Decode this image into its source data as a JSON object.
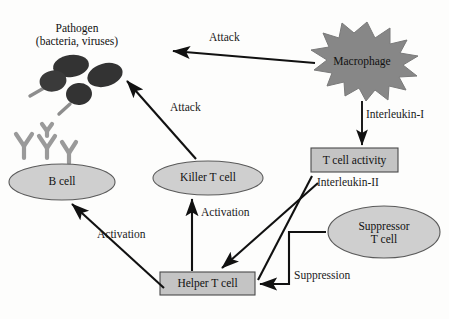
{
  "figure": {
    "background_color": "#fdfdfc",
    "line_color": "#111111",
    "cell_fill": "#cfcfcf",
    "cell_stroke": "#555555",
    "box_fill": "#c4c4c4",
    "box_stroke": "#4a4a4a",
    "macrophage_fill": "#878787",
    "macrophage_stroke": "#6f6f6f",
    "pathogen_fill": "#3a3a3a",
    "antibody_color": "#9a9a9a"
  },
  "nodes": {
    "pathogen": {
      "label_line1": "Pathogen",
      "label_line2": "(bacteria, viruses)",
      "shape": "dark-ellipse-cluster"
    },
    "antibodies": {
      "name": "antibody",
      "shape": "y-shape",
      "count": 3
    },
    "b_cell": {
      "label": "B cell",
      "shape": "ellipse"
    },
    "killer_t_cell": {
      "label": "Killer T cell",
      "shape": "ellipse"
    },
    "helper_t_cell": {
      "label": "Helper T cell",
      "shape": "rectangle"
    },
    "suppressor_t_cell": {
      "label_line1": "Suppressor",
      "label_line2": "T cell",
      "shape": "ellipse"
    },
    "macrophage": {
      "label": "Macrophage",
      "shape": "spiky-star"
    },
    "t_cell_activity": {
      "label": "T cell activity",
      "shape": "rectangle"
    }
  },
  "edge_labels": {
    "attack_macrophage_to_pathogen": "Attack",
    "attack_killer_to_pathogen": "Attack",
    "interleukin_1": "Interleukin-I",
    "interleukin_2": "Interleukin-II",
    "activation_helper_to_killer": "Activation",
    "activation_helper_to_bcell": "Activation",
    "suppression": "Suppression"
  }
}
